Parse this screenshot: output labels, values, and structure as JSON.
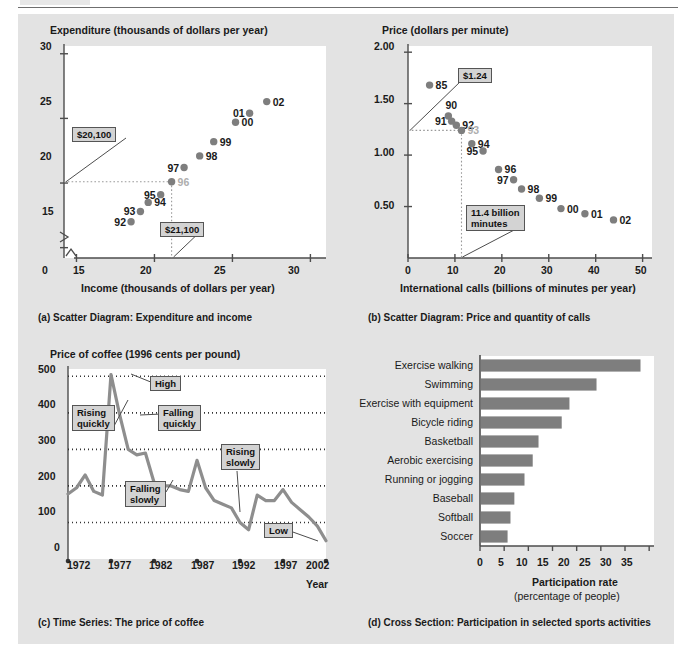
{
  "page": {
    "background": "#ffffff",
    "board_background": "#e3e3e3",
    "accent_gray": "#7e7e7e",
    "axis_color": "#4d4d4d",
    "callout_fill": "#d3d3d3"
  },
  "panel_a": {
    "caption": "(a)  Scatter Diagram: Expenditure and income",
    "y_axis_title": "Expenditure (thousands of dollars per year)",
    "x_axis_title": "Income (thousands of dollars per year)",
    "y_ticks": [
      "30",
      "25",
      "20",
      "15"
    ],
    "x_ticks": [
      "0",
      "15",
      "20",
      "25",
      "30"
    ],
    "callouts": [
      {
        "name": "expenditure-callout",
        "text": "$20,100"
      },
      {
        "name": "income-callout",
        "text": "$21,100"
      }
    ],
    "points": [
      {
        "label": "92",
        "x": 18.5,
        "y": 17.0,
        "label_side": "left"
      },
      {
        "label": "93",
        "x": 19.1,
        "y": 17.8,
        "label_side": "left"
      },
      {
        "label": "94",
        "x": 19.6,
        "y": 18.5,
        "label_side": "right"
      },
      {
        "label": "95",
        "x": 20.4,
        "y": 19.1,
        "label_side": "left"
      },
      {
        "label": "96",
        "x": 21.1,
        "y": 20.1,
        "label_side": "right",
        "muted": true
      },
      {
        "label": "97",
        "x": 21.9,
        "y": 21.2,
        "label_side": "left"
      },
      {
        "label": "98",
        "x": 22.9,
        "y": 22.1,
        "label_side": "right"
      },
      {
        "label": "99",
        "x": 23.8,
        "y": 23.2,
        "label_side": "right"
      },
      {
        "label": "00",
        "x": 25.2,
        "y": 24.7,
        "label_side": "right"
      },
      {
        "label": "01",
        "x": 26.1,
        "y": 25.4,
        "label_side": "left"
      },
      {
        "label": "02",
        "x": 27.2,
        "y": 26.3,
        "label_side": "right"
      }
    ]
  },
  "panel_b": {
    "caption": "(b)  Scatter Diagram: Price and quantity of calls",
    "y_axis_title": "Price (dollars per minute)",
    "x_axis_title": "International calls (billions of minutes per year)",
    "y_ticks": [
      "2.00",
      "1.50",
      "1.00",
      "0.50"
    ],
    "x_ticks": [
      "0",
      "10",
      "20",
      "30",
      "40",
      "50"
    ],
    "callouts": [
      {
        "name": "price-callout",
        "text": "$1.24"
      },
      {
        "name": "quantity-callout",
        "text": "11.4 billion\nminutes"
      }
    ],
    "points": [
      {
        "label": "85",
        "x": 4.6,
        "y": 1.68,
        "label_side": "right"
      },
      {
        "label": "90",
        "x": 8.6,
        "y": 1.38,
        "label_side": "top"
      },
      {
        "label": "91",
        "x": 9.3,
        "y": 1.33,
        "label_side": "left"
      },
      {
        "label": "92",
        "x": 10.3,
        "y": 1.29,
        "label_side": "right"
      },
      {
        "label": "93",
        "x": 11.4,
        "y": 1.24,
        "label_side": "right",
        "muted": true
      },
      {
        "label": "94",
        "x": 13.6,
        "y": 1.11,
        "label_side": "right"
      },
      {
        "label": "95",
        "x": 16.0,
        "y": 1.04,
        "label_side": "left"
      },
      {
        "label": "96",
        "x": 19.3,
        "y": 0.86,
        "label_side": "right"
      },
      {
        "label": "97",
        "x": 22.5,
        "y": 0.76,
        "label_side": "left"
      },
      {
        "label": "98",
        "x": 24.2,
        "y": 0.67,
        "label_side": "right"
      },
      {
        "label": "99",
        "x": 28.0,
        "y": 0.58,
        "label_side": "right"
      },
      {
        "label": "00",
        "x": 32.6,
        "y": 0.48,
        "label_side": "right"
      },
      {
        "label": "01",
        "x": 37.7,
        "y": 0.43,
        "label_side": "right"
      },
      {
        "label": "02",
        "x": 43.8,
        "y": 0.37,
        "label_side": "right"
      }
    ]
  },
  "panel_c": {
    "caption": "(c)  Time Series: The price of coffee",
    "y_axis_title": "Price of coffee (1996 cents per pound)",
    "x_axis_title": "Year",
    "y_ticks": [
      "500",
      "400",
      "300",
      "200",
      "100",
      "0"
    ],
    "x_ticks": [
      "1972",
      "1977",
      "1982",
      "1987",
      "1992",
      "1997",
      "2002"
    ],
    "annotations": [
      {
        "name": "rising-quickly-callout",
        "text": "Rising\nquickly"
      },
      {
        "name": "high-callout",
        "text": "High"
      },
      {
        "name": "falling-quickly-callout",
        "text": "Falling\nquickly"
      },
      {
        "name": "falling-slowly-callout",
        "text": "Falling\nslowly"
      },
      {
        "name": "rising-slowly-callout",
        "text": "Rising\nslowly"
      },
      {
        "name": "low-callout",
        "text": "Low"
      }
    ],
    "series": {
      "name": "Price of coffee",
      "x": [
        1972,
        1973,
        1974,
        1975,
        1976,
        1977,
        1978,
        1979,
        1980,
        1981,
        1982,
        1983,
        1984,
        1985,
        1986,
        1987,
        1988,
        1989,
        1990,
        1991,
        1992,
        1993,
        1994,
        1995,
        1996,
        1997,
        1998,
        1999,
        2000,
        2001,
        2002
      ],
      "y": [
        178,
        195,
        230,
        185,
        175,
        505,
        395,
        300,
        285,
        290,
        210,
        200,
        200,
        190,
        185,
        270,
        195,
        160,
        150,
        140,
        100,
        80,
        175,
        160,
        160,
        190,
        155,
        135,
        115,
        90,
        50
      ]
    }
  },
  "panel_d": {
    "caption": "(d)  Cross Section: Participation in selected sports activities",
    "x_axis_title_line1": "Participation rate",
    "x_axis_title_line2": "(percentage of people)",
    "x_ticks": [
      "0",
      "5",
      "10",
      "15",
      "20",
      "25",
      "30",
      "35"
    ],
    "chart": {
      "categories": [
        "Exercise walking",
        "Swimming",
        "Exercise with equipment",
        "Bicycle riding",
        "Basketball",
        "Aerobic exercising",
        "Running or jogging",
        "Baseball",
        "Softball",
        "Soccer"
      ],
      "values": [
        33.0,
        23.9,
        18.3,
        16.7,
        11.9,
        10.7,
        9.0,
        6.9,
        6.1,
        5.5
      ]
    }
  },
  "chart_data": [
    {
      "type": "scatter",
      "panel": "a",
      "title": "Scatter Diagram: Expenditure and income",
      "xlabel": "Income (thousands of dollars per year)",
      "ylabel": "Expenditure (thousands of dollars per year)",
      "xlim": [
        14,
        31
      ],
      "ylim": [
        14.2,
        30.5
      ],
      "grid": false,
      "legend": "none",
      "points": [
        {
          "label": "92",
          "x": 18.5,
          "y": 17.0
        },
        {
          "label": "93",
          "x": 19.1,
          "y": 17.8
        },
        {
          "label": "94",
          "x": 19.6,
          "y": 18.5
        },
        {
          "label": "95",
          "x": 20.4,
          "y": 19.1
        },
        {
          "label": "96",
          "x": 21.1,
          "y": 20.1
        },
        {
          "label": "97",
          "x": 21.9,
          "y": 21.2
        },
        {
          "label": "98",
          "x": 22.9,
          "y": 22.1
        },
        {
          "label": "99",
          "x": 23.8,
          "y": 23.2
        },
        {
          "label": "00",
          "x": 25.2,
          "y": 24.7
        },
        {
          "label": "01",
          "x": 26.1,
          "y": 25.4
        },
        {
          "label": "02",
          "x": 27.2,
          "y": 26.3
        }
      ],
      "annotations": [
        "$20,100",
        "$21,100"
      ]
    },
    {
      "type": "scatter",
      "panel": "b",
      "title": "Scatter Diagram: Price and quantity of calls",
      "xlabel": "International calls (billions of minutes per year)",
      "ylabel": "Price (dollars per minute)",
      "xlim": [
        0,
        52
      ],
      "ylim": [
        0,
        2.05
      ],
      "grid": false,
      "legend": "none",
      "points": [
        {
          "label": "85",
          "x": 4.6,
          "y": 1.68
        },
        {
          "label": "90",
          "x": 8.6,
          "y": 1.38
        },
        {
          "label": "91",
          "x": 9.3,
          "y": 1.33
        },
        {
          "label": "92",
          "x": 10.3,
          "y": 1.29
        },
        {
          "label": "93",
          "x": 11.4,
          "y": 1.24
        },
        {
          "label": "94",
          "x": 13.6,
          "y": 1.11
        },
        {
          "label": "95",
          "x": 16.0,
          "y": 1.04
        },
        {
          "label": "96",
          "x": 19.3,
          "y": 0.86
        },
        {
          "label": "97",
          "x": 22.5,
          "y": 0.76
        },
        {
          "label": "98",
          "x": 24.2,
          "y": 0.67
        },
        {
          "label": "99",
          "x": 28.0,
          "y": 0.58
        },
        {
          "label": "00",
          "x": 32.6,
          "y": 0.48
        },
        {
          "label": "01",
          "x": 37.7,
          "y": 0.43
        },
        {
          "label": "02",
          "x": 43.8,
          "y": 0.37
        }
      ],
      "annotations": [
        "$1.24",
        "11.4 billion minutes"
      ]
    },
    {
      "type": "line",
      "panel": "c",
      "title": "Time Series: The price of coffee",
      "xlabel": "Year",
      "ylabel": "Price of coffee (1996 cents per pound)",
      "xlim": [
        1972,
        2002
      ],
      "ylim": [
        0,
        520
      ],
      "grid": true,
      "legend": "none",
      "x": [
        1972,
        1973,
        1974,
        1975,
        1976,
        1977,
        1978,
        1979,
        1980,
        1981,
        1982,
        1983,
        1984,
        1985,
        1986,
        1987,
        1988,
        1989,
        1990,
        1991,
        1992,
        1993,
        1994,
        1995,
        1996,
        1997,
        1998,
        1999,
        2000,
        2001,
        2002
      ],
      "values": [
        178,
        195,
        230,
        185,
        175,
        505,
        395,
        300,
        285,
        290,
        210,
        200,
        200,
        190,
        185,
        270,
        195,
        160,
        150,
        140,
        100,
        80,
        175,
        160,
        160,
        190,
        155,
        135,
        115,
        90,
        50
      ],
      "annotations": [
        "Rising quickly",
        "High",
        "Falling quickly",
        "Falling slowly",
        "Rising slowly",
        "Low"
      ]
    },
    {
      "type": "bar",
      "panel": "d",
      "orientation": "horizontal",
      "title": "Cross Section: Participation in selected sports activities",
      "xlabel": "Participation rate (percentage of people)",
      "ylabel": "",
      "xlim": [
        0,
        36
      ],
      "grid": false,
      "legend": "none",
      "categories": [
        "Exercise walking",
        "Swimming",
        "Exercise with equipment",
        "Bicycle riding",
        "Basketball",
        "Aerobic exercising",
        "Running or jogging",
        "Baseball",
        "Softball",
        "Soccer"
      ],
      "values": [
        33.0,
        23.9,
        18.3,
        16.7,
        11.9,
        10.7,
        9.0,
        6.9,
        6.1,
        5.5
      ]
    }
  ]
}
